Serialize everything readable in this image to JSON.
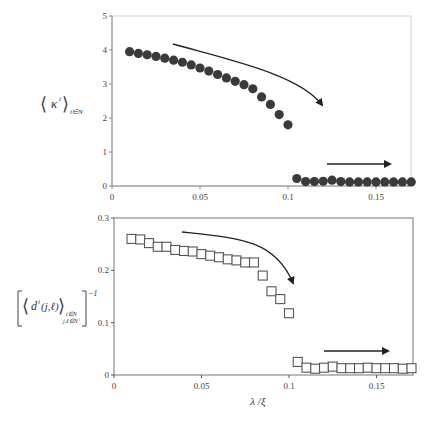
{
  "chart_data": [
    {
      "type": "scatter",
      "title": "",
      "ylabel": "⟨κⁱ⟩ i∈N",
      "xlabel": "",
      "xlim": [
        0,
        0.172
      ],
      "ylim": [
        0,
        5
      ],
      "xticks": [
        "0",
        "0.05",
        "0.1",
        "0.15"
      ],
      "xtick_values": [
        0,
        0.05,
        0.1,
        0.15
      ],
      "yticks": [
        "0",
        "1",
        "2",
        "3",
        "4",
        "5"
      ],
      "ytick_values": [
        0,
        1,
        2,
        3,
        4,
        5
      ],
      "grid": false,
      "marker": "filled-circle",
      "marker_color": "#3a3a3a",
      "annotations": [
        "curved arrow pointing down-right toward transition near x=0.1",
        "horizontal arrow pointing right in low-value region (x≈0.12–0.16)"
      ],
      "series": [
        {
          "name": "mean degree",
          "x": [
            0.01,
            0.015,
            0.02,
            0.025,
            0.03,
            0.035,
            0.04,
            0.045,
            0.05,
            0.055,
            0.06,
            0.065,
            0.07,
            0.075,
            0.08,
            0.085,
            0.09,
            0.095,
            0.1,
            0.105,
            0.11,
            0.115,
            0.12,
            0.125,
            0.13,
            0.135,
            0.14,
            0.145,
            0.15,
            0.155,
            0.16,
            0.165,
            0.17
          ],
          "y": [
            3.95,
            3.9,
            3.86,
            3.81,
            3.76,
            3.7,
            3.64,
            3.56,
            3.47,
            3.38,
            3.28,
            3.18,
            3.08,
            2.98,
            2.86,
            2.62,
            2.4,
            2.1,
            1.8,
            0.22,
            0.13,
            0.13,
            0.14,
            0.17,
            0.13,
            0.12,
            0.12,
            0.12,
            0.12,
            0.12,
            0.12,
            0.12,
            0.12
          ]
        }
      ]
    },
    {
      "type": "scatter",
      "title": "",
      "ylabel": "[⟨dⁱ(j,ℓ)⟩ i∈N, j,ℓ∈Nⁱ]⁻¹",
      "xlabel": "λ / ξ",
      "xlim": [
        0,
        0.172
      ],
      "ylim": [
        0,
        0.3
      ],
      "xticks": [
        "0",
        "0.05",
        "0.1",
        "0.15"
      ],
      "xtick_values": [
        0,
        0.05,
        0.1,
        0.15
      ],
      "yticks": [
        "0",
        "0.1",
        "0.2",
        "0.3"
      ],
      "ytick_values": [
        0,
        0.1,
        0.2,
        0.3
      ],
      "grid": false,
      "marker": "open-square",
      "marker_color": "#555555",
      "annotations": [
        "curved arrow pointing down-right toward transition near x=0.1",
        "horizontal arrow pointing right in low-value region (x≈0.12–0.16)"
      ],
      "series": [
        {
          "name": "inverse mean distance",
          "x": [
            0.01,
            0.015,
            0.02,
            0.025,
            0.03,
            0.035,
            0.04,
            0.045,
            0.05,
            0.055,
            0.06,
            0.065,
            0.07,
            0.075,
            0.08,
            0.085,
            0.09,
            0.095,
            0.1,
            0.105,
            0.11,
            0.115,
            0.12,
            0.125,
            0.13,
            0.135,
            0.14,
            0.145,
            0.15,
            0.155,
            0.16,
            0.165,
            0.17
          ],
          "y": [
            0.26,
            0.259,
            0.252,
            0.245,
            0.245,
            0.239,
            0.237,
            0.236,
            0.231,
            0.228,
            0.225,
            0.221,
            0.219,
            0.215,
            0.215,
            0.19,
            0.16,
            0.145,
            0.118,
            0.025,
            0.014,
            0.012,
            0.014,
            0.016,
            0.013,
            0.013,
            0.013,
            0.014,
            0.013,
            0.013,
            0.013,
            0.012,
            0.013
          ]
        }
      ]
    }
  ],
  "labels": {
    "top_ylabel_main": "κ",
    "top_ylabel_sup": "i",
    "top_ylabel_sub": "i∈N",
    "bottom_ylabel_main": "d",
    "bottom_ylabel_sup": "i",
    "bottom_ylabel_args": "(j,ℓ)",
    "bottom_ylabel_sub1": "i∈N",
    "bottom_ylabel_sub2": "j,ℓ∈Nⁱ",
    "bottom_ylabel_exp": "−1",
    "xlabel": "λ /ξ"
  }
}
